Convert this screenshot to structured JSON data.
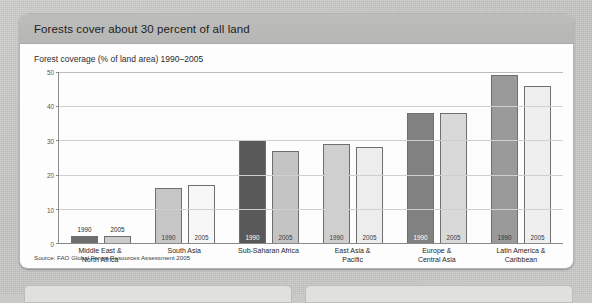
{
  "card": {
    "title": "Forests cover about 30 percent of all land",
    "subtitle": "Forest coverage (% of land area) 1990–2005",
    "source": "Source: FAO Global Forest Resources Assessment 2005"
  },
  "chart_data": {
    "type": "bar",
    "title": "Forests cover about 30 percent of all land",
    "subtitle": "Forest coverage (% of land area) 1990–2005",
    "xlabel": "",
    "ylabel": "",
    "ylim": [
      0,
      50
    ],
    "yticks": [
      0,
      10,
      20,
      30,
      40,
      50
    ],
    "grid": true,
    "legend": "none",
    "categories": [
      "Middle East &\nNorth Africa",
      "South Asia",
      "Sub-Saharan Africa",
      "East Asia &\nPacific",
      "Europe &\nCentral Asia",
      "Latin America &\nCaribbean"
    ],
    "series": [
      {
        "name": "1990",
        "values": [
          2,
          16,
          30,
          29,
          38,
          49
        ]
      },
      {
        "name": "2005",
        "values": [
          2,
          17,
          27,
          28,
          38,
          46
        ]
      }
    ],
    "bar_styles": [
      {
        "1990": "#6e6e6e",
        "2005": "#cccccc"
      },
      {
        "1990": "#c6c6c6",
        "2005": "#f7f7f7"
      },
      {
        "1990": "#595959",
        "2005": "#c4c4c4"
      },
      {
        "1990": "#cfcfcf",
        "2005": "#ededed"
      },
      {
        "1990": "#818181",
        "2005": "#d9d9d9"
      },
      {
        "1990": "#9a9a9a",
        "2005": "#efefef"
      }
    ],
    "source": "Source: FAO Global Forest Resources Assessment 2005"
  },
  "axis": {
    "ticks": [
      "50",
      "40",
      "30",
      "20",
      "10",
      "0"
    ]
  },
  "groups": [
    {
      "category_line1": "Middle East &",
      "category_line2": "North Africa",
      "bars": [
        {
          "year": "1990",
          "value": 2,
          "fill": "#6e6e6e",
          "label_color": "#2b2b2b",
          "label_outside": true
        },
        {
          "year": "2005",
          "value": 2,
          "fill": "#cccccc",
          "label_color": "#2b2b2b",
          "label_outside": true
        }
      ]
    },
    {
      "category_line1": "South Asia",
      "category_line2": "",
      "bars": [
        {
          "year": "1990",
          "value": 16,
          "fill": "#c6c6c6",
          "label_color": "#3a3a3a",
          "label_outside": false
        },
        {
          "year": "2005",
          "value": 17,
          "fill": "#f7f7f7",
          "label_color": "#3a3a3a",
          "label_outside": false
        }
      ]
    },
    {
      "category_line1": "Sub-Saharan Africa",
      "category_line2": "",
      "bars": [
        {
          "year": "1990",
          "value": 30,
          "fill": "#595959",
          "label_color": "#ffffff",
          "label_outside": false
        },
        {
          "year": "2005",
          "value": 27,
          "fill": "#c4c4c4",
          "label_color": "#3a3a3a",
          "label_outside": false
        }
      ]
    },
    {
      "category_line1": "East Asia &",
      "category_line2": "Pacific",
      "bars": [
        {
          "year": "1990",
          "value": 29,
          "fill": "#cfcfcf",
          "label_color": "#3a3a3a",
          "label_outside": false
        },
        {
          "year": "2005",
          "value": 28,
          "fill": "#ededed",
          "label_color": "#3a3a3a",
          "label_outside": false
        }
      ]
    },
    {
      "category_line1": "Europe &",
      "category_line2": "Central Asia",
      "bars": [
        {
          "year": "1990",
          "value": 38,
          "fill": "#818181",
          "label_color": "#ffffff",
          "label_outside": false
        },
        {
          "year": "2005",
          "value": 38,
          "fill": "#d9d9d9",
          "label_color": "#3a3a3a",
          "label_outside": false
        }
      ]
    },
    {
      "category_line1": "Latin America &",
      "category_line2": "Caribbean",
      "bars": [
        {
          "year": "1990",
          "value": 49,
          "fill": "#9a9a9a",
          "label_color": "#2f2f2f",
          "label_outside": false
        },
        {
          "year": "2005",
          "value": 46,
          "fill": "#efefef",
          "label_color": "#3a3a3a",
          "label_outside": false
        }
      ]
    }
  ]
}
